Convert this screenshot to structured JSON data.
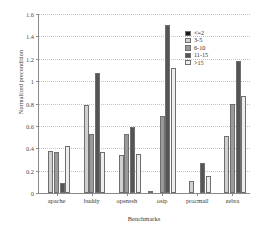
{
  "chart_data": {
    "type": "bar",
    "title": "",
    "xlabel": "Benchmarks",
    "ylabel": "Normalized precondition",
    "categories": [
      "apache",
      "buddy",
      "openssh",
      "osip",
      "procmail",
      "zebra"
    ],
    "series": [
      {
        "name": "<=2",
        "color": "#1a1a1a",
        "values": [
          0.0,
          0.0,
          0.0,
          0.01,
          0.0,
          0.0
        ]
      },
      {
        "name": "3-5",
        "color": "#d0d0d0",
        "values": [
          0.38,
          0.79,
          0.34,
          0.0,
          0.11,
          0.51
        ]
      },
      {
        "name": "6-10",
        "color": "#9a9a9a",
        "values": [
          0.37,
          0.53,
          0.53,
          0.69,
          0.0,
          0.8
        ]
      },
      {
        "name": "11-15",
        "color": "#555555",
        "values": [
          0.09,
          1.07,
          0.59,
          1.5,
          0.27,
          1.18
        ]
      },
      {
        "name": ">15",
        "color": "#ededed",
        "values": [
          0.42,
          0.37,
          0.35,
          1.12,
          0.15,
          0.87
        ]
      }
    ],
    "ylim": [
      0,
      1.6
    ],
    "yticks": [
      "0",
      "0.2",
      "0.4",
      "0.6",
      "0.8",
      "1",
      "1.2",
      "1.4",
      "1.6"
    ],
    "ytick_values": [
      0,
      0.2,
      0.4,
      0.6,
      0.8,
      1.0,
      1.2,
      1.4,
      1.6
    ],
    "grid": true,
    "legend_position": "top-right"
  }
}
